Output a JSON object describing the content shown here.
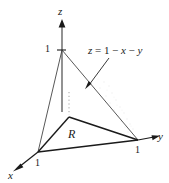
{
  "figure": {
    "axes": {
      "z_label": "z",
      "y_label": "y",
      "x_label": "x"
    },
    "ticks": {
      "z_one": "1",
      "y_one": "1",
      "x_one": "1"
    },
    "region_label": "R",
    "equation": {
      "full": "z = 1 − x − y",
      "lhs": "z",
      "eq_sign": "=",
      "term_one": "1",
      "minus_one": "−",
      "term_x": "x",
      "minus_two": "−",
      "term_y": "y"
    },
    "colors": {
      "stroke": "#1a1a1a",
      "thin_stroke": "#3a3a3a",
      "dotted": "#9a9a9a",
      "stipple": "#c9c9c9",
      "background": "#ffffff"
    },
    "geometry": {
      "origin": [
        38,
        152
      ],
      "z_top_vertex": [
        62,
        50
      ],
      "y_vertex": [
        138,
        140
      ],
      "base_apex": [
        69,
        117
      ],
      "z_axis_arrow_tip": [
        62,
        20
      ],
      "y_axis_arrow_tip": [
        160,
        136
      ],
      "x_axis_arrow_tip": [
        13,
        171
      ],
      "callout_arrow_start": [
        109,
        58
      ],
      "callout_arrow_end": [
        86,
        89
      ]
    }
  }
}
